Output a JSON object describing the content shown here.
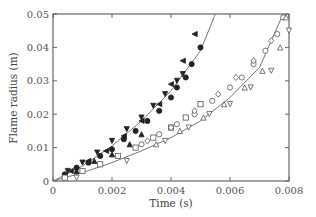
{
  "chart_data": {
    "type": "scatter",
    "title": "",
    "xlabel": "Time (s)",
    "ylabel": "Flame radius (m)",
    "xlim": [
      0,
      0.008
    ],
    "ylim": [
      0,
      0.05
    ],
    "xticks": [
      0,
      0.002,
      0.004,
      0.006,
      0.008
    ],
    "xtick_labels": [
      "0",
      "0.002",
      "0.004",
      "0.006",
      "0.008"
    ],
    "yticks": [
      0,
      0.01,
      0.02,
      0.03,
      0.04,
      0.05
    ],
    "ytick_labels": [
      "0",
      "0.01",
      "0.02",
      "0.03",
      "0.04",
      "0.05"
    ],
    "grid": false,
    "legend": null,
    "series": [
      {
        "name": "filled circles",
        "marker": "circle-filled",
        "x": [
          0.0004,
          0.0008,
          0.0012,
          0.0016,
          0.002,
          0.0024,
          0.0028,
          0.0032,
          0.0036,
          0.004,
          0.0042,
          0.0045,
          0.0047,
          0.005
        ],
        "y": [
          0.002,
          0.004,
          0.0055,
          0.0075,
          0.0095,
          0.0125,
          0.015,
          0.018,
          0.021,
          0.025,
          0.028,
          0.031,
          0.035,
          0.04
        ]
      },
      {
        "name": "filled down-triangles",
        "marker": "triangle-down-filled",
        "x": [
          0.0005,
          0.001,
          0.0015,
          0.002,
          0.0025,
          0.003,
          0.0034,
          0.0038,
          0.0042,
          0.0044
        ],
        "y": [
          0.003,
          0.0055,
          0.0085,
          0.012,
          0.0155,
          0.019,
          0.0225,
          0.026,
          0.03,
          0.032
        ]
      },
      {
        "name": "filled left-triangles",
        "marker": "triangle-left-filled",
        "x": [
          0.0006,
          0.0012,
          0.0018,
          0.0024,
          0.003,
          0.0036,
          0.004,
          0.0044,
          0.0048
        ],
        "y": [
          0.003,
          0.006,
          0.009,
          0.0135,
          0.018,
          0.023,
          0.029,
          0.036,
          0.044
        ]
      },
      {
        "name": "filled up-triangles",
        "marker": "triangle-up-filled",
        "x": [
          0.0008,
          0.0014,
          0.002,
          0.0026,
          0.003
        ],
        "y": [
          0.003,
          0.006,
          0.008,
          0.011,
          0.014
        ]
      },
      {
        "name": "open squares",
        "marker": "square-open",
        "x": [
          0.0004,
          0.001,
          0.0016,
          0.0022,
          0.0028,
          0.0034,
          0.004,
          0.0045,
          0.005
        ],
        "y": [
          0.001,
          0.003,
          0.005,
          0.0075,
          0.01,
          0.013,
          0.016,
          0.019,
          0.023
        ]
      },
      {
        "name": "open circles",
        "marker": "circle-open",
        "x": [
          0.003,
          0.0036,
          0.0042,
          0.0048,
          0.0054,
          0.006,
          0.0064,
          0.0068,
          0.0072,
          0.0076,
          0.0078
        ],
        "y": [
          0.011,
          0.014,
          0.017,
          0.02,
          0.024,
          0.028,
          0.031,
          0.035,
          0.039,
          0.044,
          0.049
        ]
      },
      {
        "name": "open diamonds",
        "marker": "diamond-open",
        "x": [
          0.0032,
          0.004,
          0.0048,
          0.0056,
          0.0062,
          0.0068,
          0.0074
        ],
        "y": [
          0.012,
          0.016,
          0.021,
          0.026,
          0.031,
          0.036,
          0.042
        ]
      },
      {
        "name": "open up-triangles",
        "marker": "triangle-up-open",
        "x": [
          0.0035,
          0.0043,
          0.0051,
          0.0058,
          0.0065,
          0.0071,
          0.0077,
          0.0079
        ],
        "y": [
          0.011,
          0.015,
          0.019,
          0.023,
          0.028,
          0.033,
          0.04,
          0.049
        ]
      },
      {
        "name": "open down-triangles",
        "marker": "triangle-down-open",
        "x": [
          0.0008,
          0.0025,
          0.0038,
          0.0046,
          0.0053,
          0.006,
          0.0067,
          0.0074,
          0.008
        ],
        "y": [
          0.001,
          0.006,
          0.012,
          0.016,
          0.02,
          0.023,
          0.028,
          0.033,
          0.045
        ]
      },
      {
        "name": "fit fast",
        "marker": "line",
        "x": [
          0,
          0.001,
          0.002,
          0.003,
          0.004,
          0.005,
          0.0055
        ],
        "y": [
          0,
          0.0045,
          0.0105,
          0.018,
          0.027,
          0.039,
          0.05
        ]
      },
      {
        "name": "fit slow",
        "marker": "line",
        "x": [
          0,
          0.001,
          0.002,
          0.003,
          0.004,
          0.005,
          0.006,
          0.007,
          0.0078
        ],
        "y": [
          0,
          0.0025,
          0.0055,
          0.009,
          0.013,
          0.018,
          0.025,
          0.034,
          0.05
        ]
      }
    ]
  }
}
